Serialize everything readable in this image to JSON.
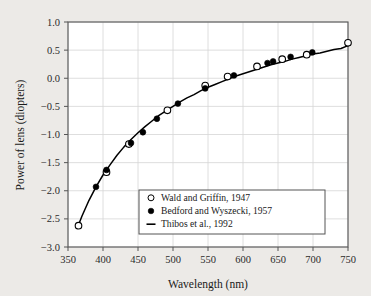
{
  "chart_data": {
    "type": "scatter",
    "title": "",
    "xlabel": "Wavelength (nm)",
    "ylabel": "Power of lens (diopters)",
    "xlim": [
      350,
      750
    ],
    "ylim": [
      -3.0,
      1.0
    ],
    "xticks": [
      350,
      400,
      450,
      500,
      550,
      600,
      650,
      700,
      750
    ],
    "yticks": [
      "1.0",
      "0.5",
      "0.0",
      "-0.5",
      "-1.0",
      "-1.5",
      "-2.0",
      "-2.5",
      "-3.0"
    ],
    "ytick_values": [
      1.0,
      0.5,
      0.0,
      -0.5,
      -1.0,
      -1.5,
      -2.0,
      -2.5,
      -3.0
    ],
    "grid": true,
    "legend_position": "lower right",
    "series": [
      {
        "name": "Wald and Griffin, 1947",
        "marker": "open-circle",
        "points": [
          [
            365,
            -2.62
          ],
          [
            405,
            -1.67
          ],
          [
            437,
            -1.17
          ],
          [
            492,
            -0.57
          ],
          [
            546,
            -0.13
          ],
          [
            578,
            0.03
          ],
          [
            620,
            0.21
          ],
          [
            656,
            0.34
          ],
          [
            691,
            0.42
          ],
          [
            750,
            0.63
          ]
        ]
      },
      {
        "name": "Bedford and Wyszecki, 1957",
        "marker": "filled-circle",
        "points": [
          [
            390,
            -1.93
          ],
          [
            405,
            -1.63
          ],
          [
            440,
            -1.15
          ],
          [
            457,
            -0.96
          ],
          [
            477,
            -0.72
          ],
          [
            507,
            -0.45
          ],
          [
            546,
            -0.18
          ],
          [
            587,
            0.05
          ],
          [
            635,
            0.27
          ],
          [
            643,
            0.3
          ],
          [
            668,
            0.38
          ],
          [
            699,
            0.46
          ]
        ]
      },
      {
        "name": "Thibos et al., 1992",
        "marker": "line",
        "curve": [
          [
            363,
            -2.67
          ],
          [
            370,
            -2.45
          ],
          [
            380,
            -2.17
          ],
          [
            390,
            -1.93
          ],
          [
            400,
            -1.72
          ],
          [
            410,
            -1.54
          ],
          [
            420,
            -1.37
          ],
          [
            430,
            -1.22
          ],
          [
            440,
            -1.09
          ],
          [
            450,
            -0.97
          ],
          [
            460,
            -0.86
          ],
          [
            470,
            -0.76
          ],
          [
            480,
            -0.66
          ],
          [
            490,
            -0.58
          ],
          [
            500,
            -0.5
          ],
          [
            510,
            -0.42
          ],
          [
            520,
            -0.35
          ],
          [
            530,
            -0.29
          ],
          [
            540,
            -0.22
          ],
          [
            550,
            -0.16
          ],
          [
            560,
            -0.11
          ],
          [
            570,
            -0.06
          ],
          [
            580,
            -0.01
          ],
          [
            590,
            0.04
          ],
          [
            600,
            0.08
          ],
          [
            610,
            0.12
          ],
          [
            620,
            0.16
          ],
          [
            630,
            0.2
          ],
          [
            640,
            0.24
          ],
          [
            650,
            0.27
          ],
          [
            660,
            0.3
          ],
          [
            670,
            0.34
          ],
          [
            680,
            0.37
          ],
          [
            690,
            0.4
          ],
          [
            700,
            0.43
          ],
          [
            710,
            0.45
          ],
          [
            720,
            0.48
          ],
          [
            730,
            0.51
          ],
          [
            740,
            0.53
          ],
          [
            750,
            0.58
          ]
        ]
      }
    ],
    "legend": [
      {
        "label": "Wald and Griffin, 1947",
        "marker": "open-circle"
      },
      {
        "label": "Bedford and Wyszecki, 1957",
        "marker": "filled-circle"
      },
      {
        "label": "Thibos et al., 1992",
        "marker": "line"
      }
    ],
    "colors": {
      "line": "#000000",
      "marker_fill": "#000000",
      "marker_open_fill": "#ffffff",
      "grid": "#d6d6d6",
      "frame": "#555555",
      "plot_bg": "#ffffff",
      "page_bg": "#eceae7"
    }
  }
}
